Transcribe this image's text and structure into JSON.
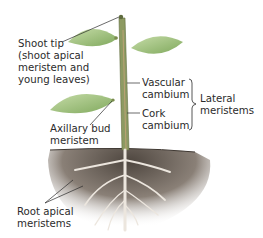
{
  "diagram": {
    "labels": {
      "shoot_tip": "Shoot tip\n(shoot apical\nmeristem and\nyoung leaves)",
      "vascular_cambium": "Vascular\ncambium",
      "cork_cambium": "Cork\ncambium",
      "lateral_meristems": "Lateral\nmeristems",
      "axillary_bud": "Axillary bud\nmeristem",
      "root_apical": "Root apical\nmeristems"
    },
    "colors": {
      "leaf": "#9cc07a",
      "leaf_dark": "#6f9a52",
      "stem": "#7a8a4e",
      "soil": "#6b6055",
      "root": "#e8e2da",
      "leader_line": "#2b2b2b"
    }
  }
}
